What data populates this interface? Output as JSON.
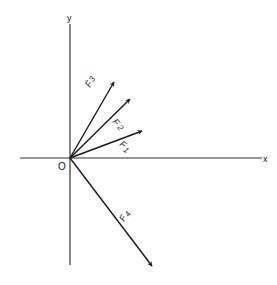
{
  "diagram": {
    "type": "vector-diagram",
    "axes": {
      "x_label": "x",
      "y_label": "y",
      "origin_label": "O"
    },
    "vectors": [
      {
        "id": "F1",
        "label_main": "F",
        "label_sub": "1",
        "angle_deg": 21,
        "color": "#1a1a1a"
      },
      {
        "id": "F2",
        "label_main": "F",
        "label_sub": "2",
        "angle_deg": 41,
        "color": "#1a1a1a"
      },
      {
        "id": "F3",
        "label_main": "F",
        "label_sub": "3",
        "angle_deg": 60,
        "color": "#1a1a1a"
      },
      {
        "id": "F4",
        "label_main": "F",
        "label_sub": "4",
        "angle_deg": -55,
        "color": "#1a1a1a"
      }
    ],
    "line_color": "#1a1a1a",
    "background": "#ffffff"
  }
}
